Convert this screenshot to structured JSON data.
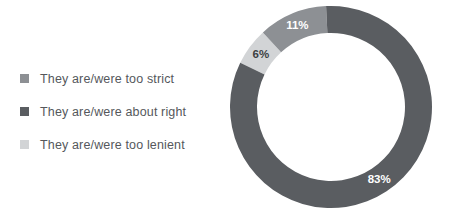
{
  "legend": {
    "items": [
      {
        "label": "They are/were too strict",
        "color": "#8d9094",
        "key": "strict"
      },
      {
        "label": "They are/were about right",
        "color": "#5a5d61",
        "key": "about-right"
      },
      {
        "label": "They are/were too lenient",
        "color": "#d2d4d6",
        "key": "lenient"
      }
    ]
  },
  "chart_data": {
    "type": "pie",
    "variant": "donut",
    "title": "",
    "xlabel": "",
    "ylabel": "",
    "legend_position": "left",
    "grid": false,
    "units": "percent",
    "start_angle_deg": -64,
    "direction": "clockwise",
    "categories": [
      "They are/were too lenient",
      "They are/were too strict",
      "They are/were about right"
    ],
    "values": [
      6,
      11,
      83
    ],
    "labels": [
      "6%",
      "11%",
      "83%"
    ],
    "colors": [
      "#d2d4d6",
      "#8d9094",
      "#5a5d61"
    ],
    "label_colors": [
      "#3c3f42",
      "#ffffff",
      "#ffffff"
    ],
    "slices": [
      {
        "name": "They are/were too lenient",
        "value": 6,
        "label": "6%",
        "color": "#d2d4d6",
        "label_color": "#3c3f42"
      },
      {
        "name": "They are/were too strict",
        "value": 11,
        "label": "11%",
        "color": "#8d9094",
        "label_color": "#ffffff"
      },
      {
        "name": "They are/were about right",
        "value": 83,
        "label": "83%",
        "color": "#5a5d61",
        "label_color": "#ffffff"
      }
    ]
  }
}
